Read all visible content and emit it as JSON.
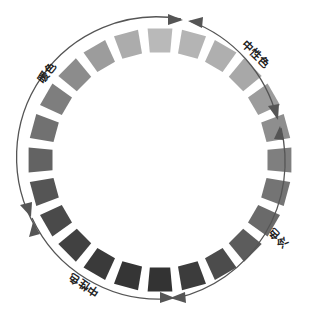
{
  "diagram": {
    "type": "color-wheel-grayscale",
    "center": [
      160,
      160
    ],
    "tile_count": 24,
    "tiles": [
      {
        "index": 0,
        "color": "#b9b9b9"
      },
      {
        "index": 1,
        "color": "#b4b4b4"
      },
      {
        "index": 2,
        "color": "#afafaf"
      },
      {
        "index": 3,
        "color": "#a8a8a8"
      },
      {
        "index": 4,
        "color": "#9c9c9c"
      },
      {
        "index": 5,
        "color": "#8e8e8e"
      },
      {
        "index": 6,
        "color": "#7f7f7f"
      },
      {
        "index": 7,
        "color": "#747474"
      },
      {
        "index": 8,
        "color": "#6a6a6a"
      },
      {
        "index": 9,
        "color": "#5c5c5c"
      },
      {
        "index": 10,
        "color": "#4c4c4c"
      },
      {
        "index": 11,
        "color": "#3c3c3c"
      },
      {
        "index": 12,
        "color": "#333333"
      },
      {
        "index": 13,
        "color": "#353535"
      },
      {
        "index": 14,
        "color": "#3a3a3a"
      },
      {
        "index": 15,
        "color": "#414141"
      },
      {
        "index": 16,
        "color": "#4a4a4a"
      },
      {
        "index": 17,
        "color": "#555555"
      },
      {
        "index": 18,
        "color": "#636363"
      },
      {
        "index": 19,
        "color": "#717171"
      },
      {
        "index": 20,
        "color": "#7e7e7e"
      },
      {
        "index": 21,
        "color": "#8c8c8c"
      },
      {
        "index": 22,
        "color": "#9c9c9c"
      },
      {
        "index": 23,
        "color": "#acacac"
      }
    ],
    "labels": {
      "warm": "暖色",
      "neutral_top": "中性色",
      "cool": "冷色",
      "neutral_bottom": "中性色"
    },
    "arc_color": "#555555"
  }
}
